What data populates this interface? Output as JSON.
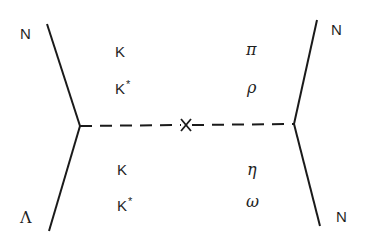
{
  "diagram": {
    "type": "exchange-diagram",
    "line_color": "#1a1a1a",
    "vertices": {
      "left": {
        "x": 80,
        "y": 126
      },
      "right": {
        "x": 294,
        "y": 124
      },
      "cross": {
        "x": 186,
        "y": 125
      }
    },
    "external_legs": {
      "top_left": {
        "label": "N"
      },
      "bottom_left": {
        "label": "Λ"
      },
      "top_right": {
        "label": "N"
      },
      "bottom_right": {
        "label": "N"
      }
    },
    "exchange_labels": {
      "upper_left": [
        {
          "base": "K",
          "sup": ""
        },
        {
          "base": "K",
          "sup": "*"
        }
      ],
      "lower_left": [
        {
          "base": "K",
          "sup": ""
        },
        {
          "base": "K",
          "sup": "*"
        }
      ],
      "upper_right": [
        {
          "base": "π"
        },
        {
          "base": "ρ"
        }
      ],
      "lower_right": [
        {
          "base": "η"
        },
        {
          "base": "ω"
        }
      ]
    },
    "propagator_style": "dashed",
    "cross_mark": "×"
  }
}
